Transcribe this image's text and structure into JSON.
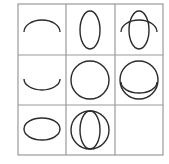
{
  "puzzle": {
    "type": "3x3 figure matrix",
    "colors": {
      "grid": "#9a9a9a",
      "stroke": "#2a2a2a",
      "background": "#ffffff"
    },
    "cells": [
      {
        "row": 1,
        "col": 1,
        "content": "upper arc (top half of horizontal ellipse)"
      },
      {
        "row": 1,
        "col": 2,
        "content": "vertical ellipse"
      },
      {
        "row": 1,
        "col": 3,
        "content": "upper arc overlaid on vertical ellipse"
      },
      {
        "row": 2,
        "col": 1,
        "content": "lower arc (bottom half of horizontal ellipse)"
      },
      {
        "row": 2,
        "col": 2,
        "content": "circle"
      },
      {
        "row": 2,
        "col": 3,
        "content": "lower arc overlaid on circle"
      },
      {
        "row": 3,
        "col": 1,
        "content": "horizontal ellipse"
      },
      {
        "row": 3,
        "col": 2,
        "content": "vertical ellipse overlaid on circle"
      },
      {
        "row": 3,
        "col": 3,
        "content": "empty (missing answer)"
      }
    ]
  }
}
